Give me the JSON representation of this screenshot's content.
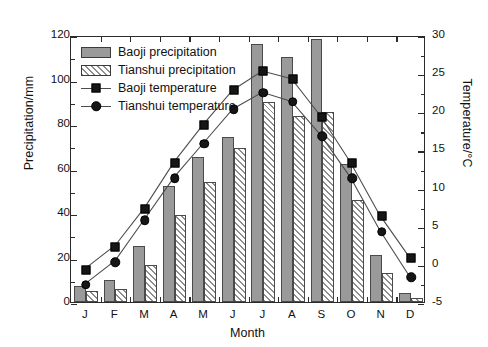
{
  "chart_data": {
    "type": "bar",
    "title": "",
    "subtitle": "",
    "xlabel": "Month",
    "ylabel": "Precipitation/mm",
    "ylabel_secondary": "Temperature/°C",
    "categories": [
      "J",
      "F",
      "M",
      "A",
      "M",
      "J",
      "J",
      "A",
      "S",
      "O",
      "N",
      "D"
    ],
    "ylim": [
      0,
      120
    ],
    "yticks": [
      0,
      20,
      40,
      60,
      80,
      100,
      120
    ],
    "ylim_secondary": [
      -5,
      30
    ],
    "yticks_secondary": [
      -5,
      0,
      5,
      10,
      15,
      20,
      25,
      30
    ],
    "grid": false,
    "legend_position": "upper left",
    "series": [
      {
        "name": "Baoji precipitation",
        "kind": "bar",
        "fill": "solid",
        "axis": "left",
        "values": [
          7,
          10,
          25,
          52,
          65,
          74,
          116,
          110,
          118,
          62,
          21,
          4
        ]
      },
      {
        "name": "Tianshui precipitation",
        "kind": "bar",
        "fill": "hatched",
        "axis": "left",
        "values": [
          5,
          6,
          16.5,
          39,
          54,
          69,
          90,
          83.5,
          85.5,
          46,
          13,
          2
        ]
      },
      {
        "name": "Baoji temperature",
        "kind": "line",
        "marker": "square",
        "axis": "right",
        "values": [
          -0.5,
          2.5,
          7.5,
          13.5,
          18.5,
          23,
          25.5,
          24.5,
          19.5,
          13.5,
          6.5,
          1
        ]
      },
      {
        "name": "Tianshui temperature",
        "kind": "line",
        "marker": "circle",
        "axis": "right",
        "values": [
          -2.5,
          0.5,
          6,
          11.5,
          16,
          20.5,
          22.7,
          21.5,
          17,
          11.5,
          4.5,
          -1.5
        ]
      }
    ]
  },
  "legend": {
    "entries": [
      {
        "label": "Baoji precipitation",
        "swatch": "solid-bar-swatch"
      },
      {
        "label": "Tianshui precipitation",
        "swatch": "hatched-bar-swatch"
      },
      {
        "label": "Baoji temperature",
        "swatch": "line-square-swatch"
      },
      {
        "label": "Tianshui temperature",
        "swatch": "line-circle-swatch"
      }
    ]
  },
  "colors": {
    "bar_solid_fill": "#9a9a9a",
    "bar_edge": "#4a4a4a",
    "hatch_stroke": "#8d8d8d",
    "line_color": "#4c4c4c",
    "marker_fill": "#161616",
    "axis": "#2b2b2b",
    "background": "#ffffff"
  }
}
